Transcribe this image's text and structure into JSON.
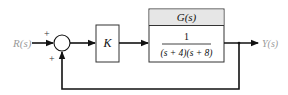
{
  "diagram": {
    "type": "block-diagram",
    "input": {
      "label": "R(s)",
      "color": "#9a9a9a"
    },
    "output": {
      "label": "Y(s)",
      "color": "#9a9a9a"
    },
    "summing_junction": {
      "top_sign": "+",
      "bottom_sign": "+"
    },
    "gain_block": {
      "label": "K"
    },
    "plant_block": {
      "header": "G(s)",
      "numerator": "1",
      "denominator": "(s + 4)(s + 8)",
      "header_color": "#e6e6e6"
    },
    "feedback": {
      "type": "unity",
      "sign": "+"
    },
    "line_color": "#111111"
  }
}
